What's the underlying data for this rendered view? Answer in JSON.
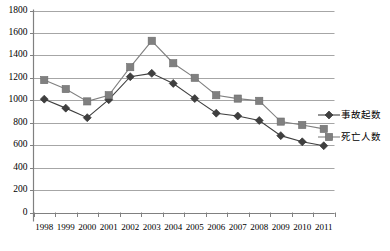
{
  "chart_data": {
    "type": "line",
    "title": "",
    "xlabel": "",
    "ylabel": "",
    "categories": [
      "1998",
      "1999",
      "2000",
      "2001",
      "2002",
      "2003",
      "2004",
      "2005",
      "2006",
      "2007",
      "2008",
      "2009",
      "2010",
      "2011"
    ],
    "series": [
      {
        "name": "事故起数",
        "marker": "diamond",
        "color": "#3f3f3f",
        "values": [
          1010,
          930,
          845,
          1005,
          1210,
          1240,
          1150,
          1015,
          885,
          860,
          820,
          685,
          630,
          595
        ]
      },
      {
        "name": "死亡人数",
        "marker": "square",
        "color": "#808080",
        "values": [
          1180,
          1100,
          990,
          1045,
          1295,
          1530,
          1330,
          1200,
          1045,
          1015,
          995,
          810,
          780,
          745
        ]
      }
    ],
    "ylim": [
      0,
      1800
    ],
    "ytick_step": 200,
    "ytick_labels": [
      "1800",
      "1600",
      "1400",
      "1200",
      "1000",
      "800",
      "600",
      "400",
      "200",
      "0"
    ],
    "grid": true,
    "grid_color": "#a6a6a6",
    "axis_color": "#808080",
    "legend_position": "right"
  }
}
